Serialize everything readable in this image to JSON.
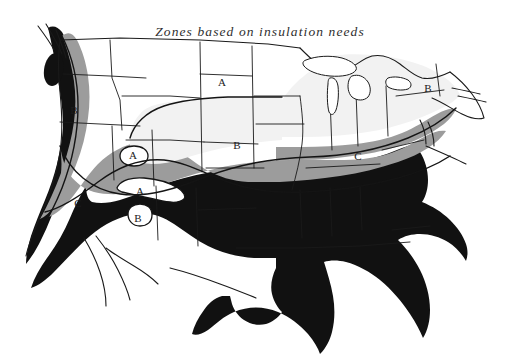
{
  "figure": {
    "title": "Zones based on insulation needs",
    "background_color": "#ffffff",
    "ink_color": "#1a1a1a",
    "media": "scanned halftone line map"
  },
  "map": {
    "subject": "Contiguous United States",
    "projection_note": "state outlines with climate zone bands",
    "zone_fills": {
      "zone_a_color": "#ffffff",
      "zone_b_color": "#f2f2f2",
      "zone_c_color": "#9c9c9c",
      "zone_d_color": "#111111"
    },
    "zone_labels": [
      {
        "id": "label-a-dakotas",
        "text": "A",
        "x": 222,
        "y": 83,
        "zone": "A",
        "region": "northern plains"
      },
      {
        "id": "label-a-nw-enclave",
        "text": "A",
        "x": 133,
        "y": 156,
        "zone": "A",
        "region": "great basin enclave"
      },
      {
        "id": "label-a-sw-enclave",
        "text": "A",
        "x": 140,
        "y": 192,
        "zone": "A",
        "region": "southern great basin enclave"
      },
      {
        "id": "label-b-northwest",
        "text": "B",
        "x": 74,
        "y": 111,
        "zone": "B",
        "region": "pacific northwest interior"
      },
      {
        "id": "label-b-plains",
        "text": "B",
        "x": 237,
        "y": 146,
        "zone": "B",
        "region": "central plains"
      },
      {
        "id": "label-b-northeast",
        "text": "B",
        "x": 428,
        "y": 89,
        "zone": "B",
        "region": "northeast"
      },
      {
        "id": "label-b-southwest",
        "text": "B",
        "x": 138,
        "y": 219,
        "zone": "B",
        "region": "southwest enclave"
      },
      {
        "id": "label-c-california",
        "text": "C",
        "x": 78,
        "y": 204,
        "zone": "C",
        "region": "california interior"
      },
      {
        "id": "label-c-midatlantic",
        "text": "C",
        "x": 358,
        "y": 157,
        "zone": "C",
        "region": "mid-atlantic"
      }
    ]
  }
}
